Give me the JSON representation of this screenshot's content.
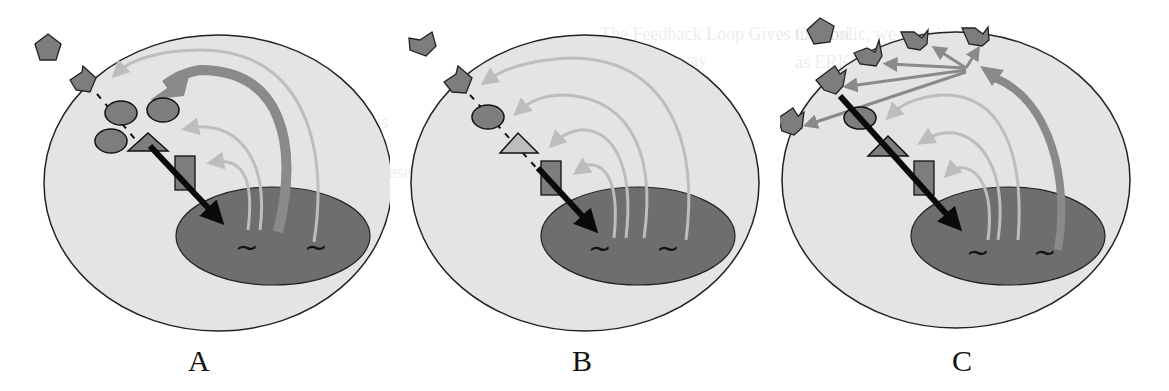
{
  "figure": {
    "panels": [
      {
        "id": "A",
        "label": "A",
        "description": "Receptor with ligand; signal via multiple adaptors (ellipses, triangle, square) to nucleus; strong feedback arrow (thick) back to pathway components"
      },
      {
        "id": "B",
        "label": "B",
        "description": "Linear cascade: receptor -> ellipse -> triangle -> square -> nucleus; four thin feedback arrows from nucleus genes to each component"
      },
      {
        "id": "C",
        "label": "C",
        "description": "Multiple receptors on membrane; thick feedback arrow induces new receptor expression, fan of arrows to five receptors; strong signal to nucleus"
      }
    ],
    "colors": {
      "cell": "#e4e4e4",
      "cell_outline": "#222222",
      "nucleus": "#6e6e6e",
      "molecule": "#7d7d7d",
      "thin_feedback": "#bdbdbd",
      "thick_feedback": "#8a8a8a",
      "signal_arrow": "#0a0a0a",
      "gene_glyph": "#111111"
    },
    "glyphs": {
      "gene": "~",
      "ligand": "pentagon",
      "receptor": "notched-pentagon"
    }
  },
  "bleed_text": [
    "metabolic, we surmise the",
    "as ERK and AKT, whose",
    "This relationship is",
    "the alternative is present",
    "The Feedback Loop Gives Control",
    "of the pathway"
  ]
}
